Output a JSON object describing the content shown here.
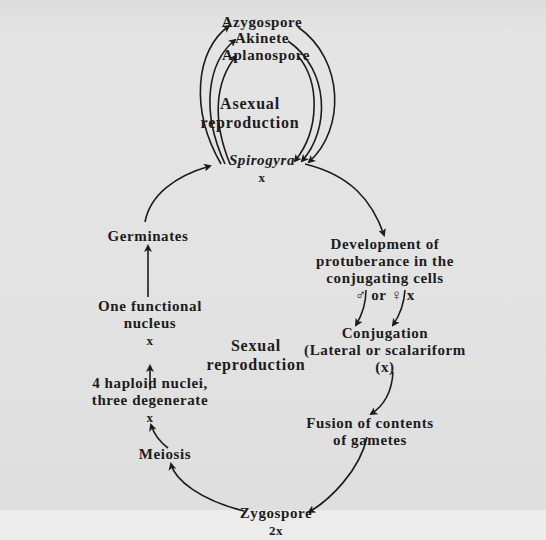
{
  "diagram": {
    "center": {
      "label": "Spirogyra",
      "ploidy": "x"
    },
    "asexual": {
      "section_label_1": "Asexual",
      "section_label_2": "reproduction",
      "spores": [
        {
          "label": "Azygospore"
        },
        {
          "label": "Akinete"
        },
        {
          "label": "Aplanospore"
        }
      ]
    },
    "sexual": {
      "section_label_1": "Sexual",
      "section_label_2": "reproduction",
      "steps": {
        "development": {
          "line1": "Development of",
          "line2": "protuberance in the",
          "line3": "conjugating cells",
          "line4": "♂ or ♀ x"
        },
        "conjugation": {
          "line1": "Conjugation",
          "line2": "(Lateral or scalariform",
          "line3": "(x)"
        },
        "fusion": {
          "line1": "Fusion of contents",
          "line2": "of gametes"
        },
        "zygospore": {
          "line1": "Zygospore",
          "line2": "2x"
        },
        "meiosis": {
          "line1": "Meiosis"
        },
        "haploid": {
          "line1": "4 haploid nuclei,",
          "line2": "three degenerate",
          "line3": "x"
        },
        "functional": {
          "line1": "One functional",
          "line2": "nucleus",
          "line3": "x"
        },
        "germinates": {
          "line1": "Germinates"
        }
      }
    }
  }
}
